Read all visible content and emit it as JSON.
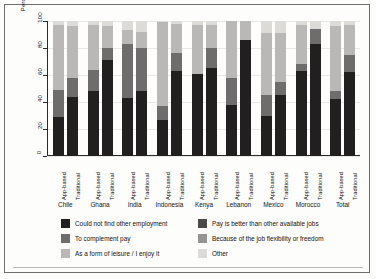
{
  "axes": {
    "ylabel": "Percentage of respondents",
    "yticks": [
      "0",
      "20",
      "40",
      "60",
      "80",
      "100"
    ],
    "bar_type_labels": [
      "App-based",
      "Traditional"
    ]
  },
  "legend": {
    "left_column": [
      {
        "label": "Could not find other employment",
        "color": "#221f20"
      },
      {
        "label": "To complement pay",
        "color": "#6e6c6d"
      },
      {
        "label": "As a form of leisure / I enjoy it",
        "color": "#b9b8b6"
      }
    ],
    "right_column": [
      {
        "label": "Pay is better than other available jobs",
        "color": "#4a4849"
      },
      {
        "label": "Because of the job flexibility or freedom",
        "color": "#969492"
      },
      {
        "label": "Other",
        "color": "#dcdbd8"
      }
    ]
  },
  "chart_data": {
    "type": "bar",
    "subtype": "stacked-bar-100",
    "title": "",
    "xlabel": "",
    "ylabel": "Percentage of respondents",
    "ylim": [
      0,
      100
    ],
    "yticks": [
      0,
      20,
      40,
      60,
      80,
      100
    ],
    "grid": true,
    "legend_position": "bottom",
    "categories": [
      "Chile",
      "Ghana",
      "India",
      "Indonesia",
      "Kenya",
      "Lebanon",
      "Mexico",
      "Morocco",
      "Total"
    ],
    "subcategories": [
      "App-based",
      "Traditional"
    ],
    "series": [
      {
        "name": "Could not find other employment",
        "color": "#221f20",
        "values": {
          "App-based": [
            29,
            48,
            43,
            27,
            61,
            38,
            30,
            63,
            42
          ],
          "Traditional": [
            44,
            71,
            48,
            63,
            65,
            86,
            45,
            83,
            62
          ]
        }
      },
      {
        "name": "To complement pay",
        "color": "#6e6c6d",
        "values": {
          "App-based": [
            20,
            16,
            40,
            10,
            0,
            20,
            15,
            5,
            6
          ],
          "Traditional": [
            14,
            9,
            32,
            13,
            15,
            0,
            10,
            11,
            13
          ]
        }
      },
      {
        "name": "As a form of leisure / I enjoy it",
        "color": "#b9b8b6",
        "values": {
          "App-based": [
            48,
            33,
            10,
            62,
            36,
            42,
            46,
            29,
            48
          ]
        }
      },
      {
        "name": "Pay is better than other available jobs",
        "color": "#4a4849",
        "values": {
          "Traditional": [
            0,
            0,
            0,
            0,
            0,
            0,
            0,
            0,
            0
          ]
        }
      },
      {
        "name": "Because of the job flexibility or freedom",
        "color": "#969492",
        "values": {
          "Traditional": [
            38,
            16,
            12,
            22,
            17,
            14,
            36,
            0,
            22
          ]
        }
      },
      {
        "name": "Other",
        "color": "#dcdbd8",
        "values": {
          "App-based": [
            3,
            3,
            7,
            1,
            3,
            0,
            9,
            3,
            4
          ],
          "Traditional": [
            4,
            4,
            8,
            2,
            3,
            0,
            9,
            6,
            3
          ]
        }
      }
    ],
    "stacks": {
      "Chile": {
        "App-based": [
          29,
          20,
          48,
          3
        ],
        "Traditional": [
          44,
          14,
          38,
          4
        ]
      },
      "Ghana": {
        "App-based": [
          48,
          16,
          33,
          3
        ],
        "Traditional": [
          71,
          9,
          16,
          4
        ]
      },
      "India": {
        "App-based": [
          43,
          40,
          10,
          7
        ],
        "Traditional": [
          48,
          32,
          12,
          8
        ]
      },
      "Indonesia": {
        "App-based": [
          27,
          10,
          62,
          1
        ],
        "Traditional": [
          63,
          13,
          22,
          2
        ]
      },
      "Kenya": {
        "App-based": [
          61,
          0,
          36,
          3
        ],
        "Traditional": [
          65,
          15,
          17,
          3
        ]
      },
      "Lebanon": {
        "App-based": [
          38,
          20,
          42,
          0
        ],
        "Traditional": [
          86,
          0,
          14,
          0
        ]
      },
      "Mexico": {
        "App-based": [
          30,
          15,
          46,
          9
        ],
        "Traditional": [
          45,
          10,
          36,
          9
        ]
      },
      "Morocco": {
        "App-based": [
          63,
          5,
          29,
          3
        ],
        "Traditional": [
          83,
          11,
          0,
          6
        ]
      },
      "Total": {
        "App-based": [
          42,
          6,
          48,
          4
        ],
        "Traditional": [
          62,
          13,
          22,
          3
        ]
      }
    }
  }
}
